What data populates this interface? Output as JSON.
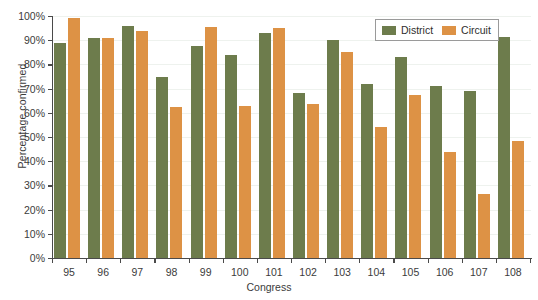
{
  "chart_data": {
    "type": "bar",
    "title": "",
    "xlabel": "Congress",
    "ylabel": "Percentage confirmed",
    "categories": [
      "95",
      "96",
      "97",
      "98",
      "99",
      "100",
      "101",
      "102",
      "103",
      "104",
      "105",
      "106",
      "107",
      "108"
    ],
    "series": [
      {
        "name": "District",
        "color": "#6d7c4c",
        "values": [
          89,
          91,
          96,
          75,
          87.5,
          84,
          93,
          68,
          90,
          72,
          83,
          71,
          69,
          91.5
        ]
      },
      {
        "name": "Circuit",
        "color": "#dd9245",
        "values": [
          99,
          91,
          94,
          62.5,
          95.5,
          63,
          95,
          63.5,
          85,
          54,
          67.5,
          44,
          26.5,
          48.5
        ]
      }
    ],
    "ylim": [
      0,
      100
    ],
    "ytick_labels": [
      "0%",
      "10%",
      "20%",
      "30%",
      "40%",
      "50%",
      "60%",
      "70%",
      "80%",
      "90%",
      "100%"
    ],
    "ytick_values": [
      0,
      10,
      20,
      30,
      40,
      50,
      60,
      70,
      80,
      90,
      100
    ],
    "grid": true,
    "legend_position": "top-right",
    "value_suffix": "%"
  },
  "legend": {
    "entries": [
      {
        "label": "District",
        "swatch": "district-swatch"
      },
      {
        "label": "Circuit",
        "swatch": "circuit-swatch"
      }
    ]
  }
}
